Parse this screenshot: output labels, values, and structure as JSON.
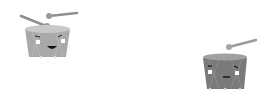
{
  "illustration": {
    "subject": "two cartoon drums with rhythm dot patterns",
    "colors": {
      "background": "#ffffff",
      "dot": "#111111",
      "drum_left_body": "#a9a9a9",
      "drum_left_top": "#c9c9c9",
      "drum_right_body": "#7a7a7a",
      "drum_right_top": "#a0a0a0",
      "stick": "#8f8f8f",
      "stick_tip": "#9a9a9a",
      "face": "#ffffff",
      "mouth": "#111111"
    },
    "drums": [
      {
        "name": "left-drum",
        "expression": "smiling",
        "x": 25,
        "y": 27,
        "w": 45,
        "h": 31
      },
      {
        "name": "right-drum",
        "expression": "neutral",
        "x": 203,
        "y": 56,
        "w": 44,
        "h": 33
      }
    ],
    "top_row_dots": [
      {
        "x": 79,
        "y": 37,
        "r": 3.5,
        "burst": false
      },
      {
        "x": 91,
        "y": 36,
        "r": 1.5,
        "burst": false
      },
      {
        "x": 102,
        "y": 36,
        "r": 2.5,
        "burst": false
      },
      {
        "x": 113,
        "y": 35,
        "r": 1.2,
        "burst": false
      },
      {
        "x": 126,
        "y": 34,
        "r": 3.5,
        "burst": true
      },
      {
        "x": 140,
        "y": 35,
        "r": 1.2,
        "burst": false
      },
      {
        "x": 150,
        "y": 35,
        "r": 2.5,
        "burst": false
      },
      {
        "x": 161,
        "y": 33,
        "r": 1.2,
        "burst": false
      },
      {
        "x": 173,
        "y": 32,
        "r": 3.5,
        "burst": false
      },
      {
        "x": 183,
        "y": 34,
        "r": 1.2,
        "burst": false
      },
      {
        "x": 197,
        "y": 34,
        "r": 2.2,
        "burst": true
      },
      {
        "x": 210,
        "y": 32,
        "r": 1.2,
        "burst": false
      },
      {
        "x": 220,
        "y": 29,
        "r": 3.5,
        "burst": false
      },
      {
        "x": 233,
        "y": 31,
        "r": 1.2,
        "burst": false
      },
      {
        "x": 244,
        "y": 29,
        "r": 2.3,
        "burst": false
      }
    ],
    "bottom_row_dots": [
      {
        "x": 48,
        "y": 71,
        "r": 1.5
      },
      {
        "x": 76,
        "y": 71,
        "r": 2.8
      },
      {
        "x": 103,
        "y": 72,
        "r": 1.5
      },
      {
        "x": 131,
        "y": 70,
        "r": 2.8
      },
      {
        "x": 161,
        "y": 70,
        "r": 1.5
      },
      {
        "x": 188,
        "y": 70,
        "r": 2.8
      }
    ]
  }
}
